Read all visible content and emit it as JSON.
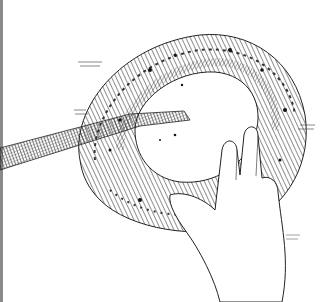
{
  "image": {
    "alt": "Pen-and-ink illustration of a hand holding a ring-shaped woven bread or wreath with a long stick passing through its center",
    "style": "black ink hatching on white",
    "colors": {
      "background": "#ffffff",
      "ink": "#1a1a1a",
      "border": "#8a8a8a"
    },
    "subjects": [
      "ring-shaped textured loaf",
      "hand",
      "stick/rod"
    ]
  }
}
